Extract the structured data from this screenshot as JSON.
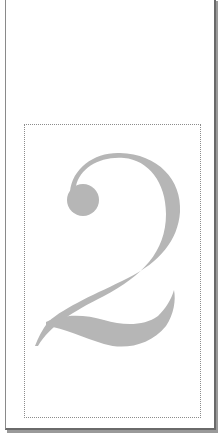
{
  "page": {
    "numeral": "2",
    "glyph_color": "#b4b4b4",
    "frame_color": "#8c8c8c"
  }
}
